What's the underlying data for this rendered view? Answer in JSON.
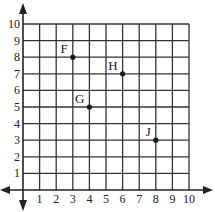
{
  "chart_data": {
    "type": "scatter",
    "title": "",
    "xlabel": "",
    "ylabel": "",
    "xlim": [
      0,
      10
    ],
    "ylim": [
      0,
      10
    ],
    "grid": true,
    "x_ticks": [
      "1",
      "2",
      "3",
      "4",
      "5",
      "6",
      "7",
      "8",
      "9",
      "10"
    ],
    "y_ticks": [
      "1",
      "2",
      "3",
      "4",
      "5",
      "6",
      "7",
      "8",
      "9",
      "10"
    ],
    "points": [
      {
        "label": "F",
        "x": 3,
        "y": 8
      },
      {
        "label": "G",
        "x": 4,
        "y": 5
      },
      {
        "label": "H",
        "x": 6,
        "y": 7
      },
      {
        "label": "J",
        "x": 8,
        "y": 3
      }
    ]
  },
  "colors": {
    "grid": "#333333",
    "axis": "#222222",
    "point": "#1a1a1a",
    "background": "#ffffff"
  }
}
